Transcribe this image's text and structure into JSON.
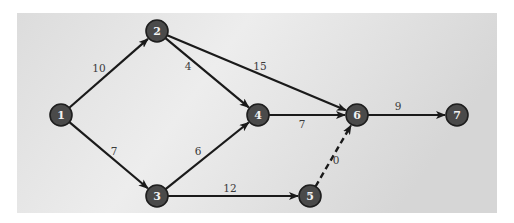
{
  "diagram": {
    "type": "activity-on-arrow network",
    "colors": {
      "panel_light": "#f4f4f4",
      "panel_dark": "#d2d2d2",
      "node_fill": "#4a4a4a",
      "node_text": "#f2f2f2",
      "edge": "#1a1a1a",
      "label_text": "#3a3a3a"
    },
    "nodes": [
      {
        "id": "1",
        "label": "1",
        "x": 61,
        "y": 115
      },
      {
        "id": "2",
        "label": "2",
        "x": 157,
        "y": 31
      },
      {
        "id": "3",
        "label": "3",
        "x": 157,
        "y": 196
      },
      {
        "id": "4",
        "label": "4",
        "x": 258,
        "y": 115
      },
      {
        "id": "5",
        "label": "5",
        "x": 310,
        "y": 196
      },
      {
        "id": "6",
        "label": "6",
        "x": 357,
        "y": 115
      },
      {
        "id": "7",
        "label": "7",
        "x": 457,
        "y": 115
      }
    ],
    "edges": [
      {
        "from": "1",
        "to": "2",
        "weight": "10",
        "style": "solid",
        "label_x": 99,
        "label_y": 68
      },
      {
        "from": "1",
        "to": "3",
        "weight": "7",
        "style": "solid",
        "label_x": 114,
        "label_y": 151
      },
      {
        "from": "2",
        "to": "4",
        "weight": "4",
        "style": "solid",
        "label_x": 188,
        "label_y": 66
      },
      {
        "from": "2",
        "to": "6",
        "weight": "15",
        "style": "solid",
        "label_x": 260,
        "label_y": 66
      },
      {
        "from": "3",
        "to": "4",
        "weight": "6",
        "style": "solid",
        "label_x": 198,
        "label_y": 151
      },
      {
        "from": "3",
        "to": "5",
        "weight": "12",
        "style": "solid",
        "label_x": 230,
        "label_y": 188
      },
      {
        "from": "4",
        "to": "6",
        "weight": "7",
        "style": "solid",
        "label_x": 302,
        "label_y": 124
      },
      {
        "from": "5",
        "to": "6",
        "weight": "0",
        "style": "dashed",
        "label_x": 336,
        "label_y": 160
      },
      {
        "from": "6",
        "to": "7",
        "weight": "9",
        "style": "solid",
        "label_x": 398,
        "label_y": 106
      }
    ]
  }
}
